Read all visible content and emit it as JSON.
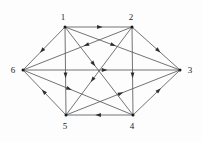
{
  "figure": {
    "type": "directed-graph",
    "width": 202,
    "height": 142,
    "background_color": "#fdfdfd",
    "edge_color": "#5a5a5a",
    "arrow_color": "#2e2e2e",
    "node_color": "#1a1a1a",
    "label_color": "#1c1c1c"
  },
  "graph_data": {
    "type": "directed-graph",
    "layout": "hexagonal",
    "directed": true,
    "node_count": 6,
    "edge_count": 15,
    "nodes": [
      {
        "id": "1",
        "label": "1",
        "x": 65,
        "y": 27,
        "label_x": 63,
        "label_y": 20,
        "label_anchor": "middle"
      },
      {
        "id": "2",
        "label": "2",
        "x": 132,
        "y": 27,
        "label_x": 131,
        "label_y": 20,
        "label_anchor": "middle"
      },
      {
        "id": "3",
        "label": "3",
        "x": 180,
        "y": 70,
        "label_x": 190,
        "label_y": 73,
        "label_anchor": "middle"
      },
      {
        "id": "4",
        "label": "4",
        "x": 133,
        "y": 115,
        "label_x": 132,
        "label_y": 129,
        "label_anchor": "middle"
      },
      {
        "id": "5",
        "label": "5",
        "x": 66,
        "y": 115,
        "label_x": 65,
        "label_y": 129,
        "label_anchor": "middle"
      },
      {
        "id": "6",
        "label": "6",
        "x": 23,
        "y": 70,
        "label_x": 13,
        "label_y": 73,
        "label_anchor": "middle"
      }
    ],
    "edges": [
      {
        "id": "e1",
        "from": "1",
        "to": "2",
        "arrow_pos": 0.52,
        "label": "1 to 2"
      },
      {
        "id": "e2",
        "from": "1",
        "to": "6",
        "arrow_pos": 0.55,
        "label": "1 to 6"
      },
      {
        "id": "e3",
        "from": "1",
        "to": "5",
        "arrow_pos": 0.55,
        "label": "1 to 5"
      },
      {
        "id": "e4",
        "from": "1",
        "to": "4",
        "arrow_pos": 0.42,
        "label": "1 to 4"
      },
      {
        "id": "e5",
        "from": "1",
        "to": "3",
        "arrow_pos": 0.42,
        "label": "1 to 3"
      },
      {
        "id": "e6",
        "from": "2",
        "to": "3",
        "arrow_pos": 0.55,
        "label": "2 to 3"
      },
      {
        "id": "e7",
        "from": "2",
        "to": "4",
        "arrow_pos": 0.55,
        "label": "2 to 4"
      },
      {
        "id": "e8",
        "from": "2",
        "to": "5",
        "arrow_pos": 0.6,
        "label": "2 to 5"
      },
      {
        "id": "e9",
        "from": "2",
        "to": "6",
        "arrow_pos": 0.42,
        "label": "2 to 6"
      },
      {
        "id": "e10",
        "from": "6",
        "to": "3",
        "arrow_pos": 0.52,
        "label": "6 to 3"
      },
      {
        "id": "e11",
        "from": "6",
        "to": "4",
        "arrow_pos": 0.42,
        "label": "6 to 4"
      },
      {
        "id": "e12",
        "from": "5",
        "to": "6",
        "arrow_pos": 0.52,
        "label": "5 to 6"
      },
      {
        "id": "e13",
        "from": "5",
        "to": "3",
        "arrow_pos": 0.48,
        "label": "5 to 3"
      },
      {
        "id": "e14",
        "from": "4",
        "to": "5",
        "arrow_pos": 0.52,
        "label": "4 to 5"
      },
      {
        "id": "e15",
        "from": "4",
        "to": "3",
        "arrow_pos": 0.55,
        "label": "4 to 3"
      }
    ]
  }
}
